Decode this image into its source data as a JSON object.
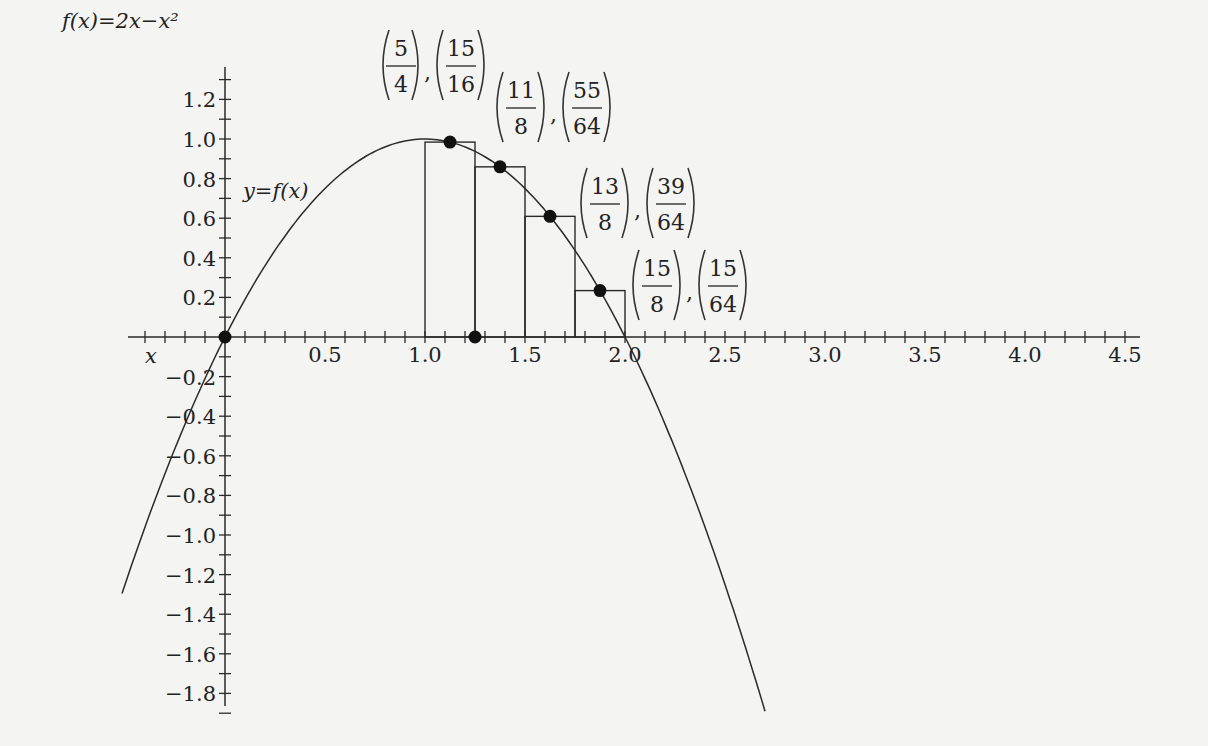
{
  "chart_data": {
    "type": "line",
    "title": "f(x)=2x−x²",
    "function": "f(x) = 2x - x^2",
    "curve_label": "y=f(x)",
    "xlabel": "x",
    "ylabel": "f(x)=2x−x²",
    "xlim": [
      -0.5,
      4.5
    ],
    "ylim": [
      -1.9,
      1.3
    ],
    "x_ticks": [
      0.5,
      1.0,
      1.5,
      2.0,
      2.5,
      3.0,
      3.5,
      4.0,
      4.5
    ],
    "x_tick_labels": [
      "0.5",
      "1.0",
      "1.5",
      "2.0",
      "2.5",
      "3.0",
      "3.5",
      "4.0",
      "4.5"
    ],
    "y_ticks": [
      1.2,
      1.0,
      0.8,
      0.6,
      0.4,
      0.2,
      -0.2,
      -0.4,
      -0.6,
      -0.8,
      -1.0,
      -1.2,
      -1.4,
      -1.6,
      -1.8
    ],
    "y_tick_labels": [
      "1.2",
      "1.0",
      "0.8",
      "0.6",
      "0.4",
      "0.2",
      "−0.2",
      "−0.4",
      "−0.6",
      "−0.8",
      "−1.0",
      "−1.2",
      "−1.4",
      "−1.6",
      "−1.8"
    ],
    "minor_tick_step": 0.1,
    "curve_domain": [
      -0.515,
      2.7
    ],
    "grid": false,
    "rectangles": [
      {
        "x0": 1.0,
        "x1": 1.25,
        "height": 0.984375
      },
      {
        "x0": 1.25,
        "x1": 1.5,
        "height": 0.859375
      },
      {
        "x0": 1.5,
        "x1": 1.75,
        "height": 0.609375
      },
      {
        "x0": 1.75,
        "x1": 2.0,
        "height": 0.234375
      }
    ],
    "points": [
      {
        "x": 0,
        "y": 0
      },
      {
        "x": 1.25,
        "y": 0
      },
      {
        "x": 1.125,
        "y": 0.984375
      },
      {
        "x": 1.375,
        "y": 0.859375
      },
      {
        "x": 1.625,
        "y": 0.609375
      },
      {
        "x": 1.875,
        "y": 0.234375
      }
    ],
    "annotations": [
      {
        "x_num": "5",
        "x_den": "4",
        "y_num": "15",
        "y_den": "16"
      },
      {
        "x_num": "11",
        "x_den": "8",
        "y_num": "55",
        "y_den": "64"
      },
      {
        "x_num": "13",
        "x_den": "8",
        "y_num": "39",
        "y_den": "64"
      },
      {
        "x_num": "15",
        "x_den": "8",
        "y_num": "15",
        "y_den": "64"
      }
    ]
  },
  "labels": {
    "function_title": "f(x)=2x−x²",
    "curve": "y=f(x)",
    "x_axis": "x"
  }
}
